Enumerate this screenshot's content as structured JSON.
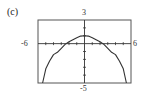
{
  "part_label": "(c)",
  "chart_data": {
    "type": "line",
    "title": "",
    "xlabel": "",
    "ylabel": "",
    "xlim": [
      -6,
      6
    ],
    "ylim": [
      -5,
      3
    ],
    "tick_labels": {
      "x_min": "-6",
      "x_max": "6",
      "y_max": "3",
      "y_min": "-5"
    },
    "grid": false,
    "x_tick_step": 1,
    "y_tick_step": 1,
    "series": [
      {
        "name": "graph",
        "x": [
          -5.4,
          -5.0,
          -4.5,
          -4.0,
          -3.5,
          -3.0,
          -2.5,
          -2.0,
          -1.5,
          -1.0,
          -0.5,
          0.0,
          0.5,
          1.0,
          1.5,
          2.0,
          2.5,
          3.0,
          3.5,
          4.0,
          4.5,
          5.0,
          5.4
        ],
        "y": [
          -5.0,
          -3.2,
          -2.2,
          -1.4,
          -1.1,
          -0.6,
          -0.1,
          0.25,
          0.5,
          0.75,
          0.95,
          1.0,
          0.95,
          0.75,
          0.5,
          0.25,
          -0.1,
          -0.6,
          -1.1,
          -1.4,
          -2.2,
          -3.2,
          -5.0
        ]
      }
    ]
  },
  "colors": {
    "axis": "#333333",
    "curve": "#333333",
    "frame": "#555555"
  }
}
